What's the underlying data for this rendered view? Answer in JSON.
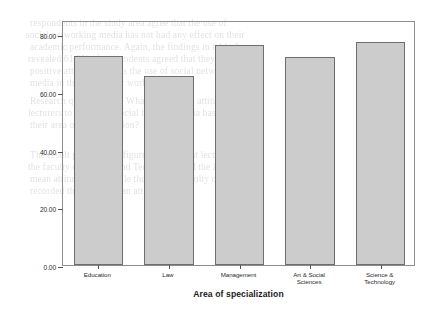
{
  "chart_data": {
    "type": "bar",
    "title": "",
    "subtitle": "",
    "xlabel": "Area of specialization",
    "ylabel": "Mean Attitude of lecturers to social network media",
    "categories": [
      "Education",
      "Law",
      "Management",
      "Art & Social Sciences",
      "Science & Technology"
    ],
    "category_lines": [
      [
        "Education"
      ],
      [
        "Law"
      ],
      [
        "Management"
      ],
      [
        "Art & Social",
        "Sciences"
      ],
      [
        "Science &",
        "Technology"
      ]
    ],
    "values": [
      72.5,
      65.5,
      76.5,
      72.0,
      77.5
    ],
    "ylim": [
      0,
      85
    ],
    "ytick_values": [
      0,
      20,
      40,
      60,
      80
    ],
    "ytick_labels": [
      "0.00",
      "20.00",
      "40.00",
      "60.00",
      "80.00"
    ],
    "grid": false,
    "legend": false,
    "legend_position": "none",
    "bar_fill_color": "#cccccc",
    "bar_border_color": "#6e6e6e",
    "frame_color": "#8d8d8d",
    "text_color": "#1a1a1a",
    "background_color": "#ffffff"
  },
  "background_ghost_text": [
    "respondents in the study area agree that the use of",
    "social networking media has not had any effect on their",
    "academic performance. Again, the findings in table 3",
    "revealed 61.2% of respondents agreed that they have",
    "positive attitude towards the use of social networking",
    "media in their academic work.",
    "Research question four: What is the mean attitude of",
    "lecturers to the use of social network media based on",
    "their area of specialization?",
    "The result presented in figure 1 shows that lecturers in",
    "the faculty of Science and Technology had the highest",
    "mean attitude score while those in the faculty of Law",
    "recorded the lowest mean attitude score."
  ]
}
